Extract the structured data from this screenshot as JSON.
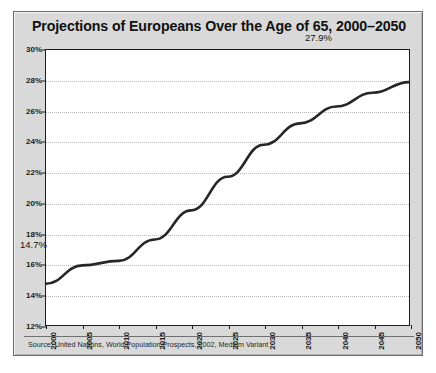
{
  "figure": {
    "title": "Projections of Europeans Over the Age of 65, 2000–2050",
    "source": "Source: United Nations, World Population Prospects, 2002, Medium Variant",
    "frame_color": "#d9d9d9",
    "plot_background": "#ffffff",
    "line_color": "#262626"
  },
  "chart_data": {
    "type": "line",
    "title": "Projections of Europeans Over the Age of 65, 2000–2050",
    "xlabel": "",
    "ylabel": "",
    "xlim": [
      2000,
      2050
    ],
    "ylim": [
      12,
      30
    ],
    "grid": true,
    "legend": false,
    "x": [
      2000,
      2005,
      2010,
      2015,
      2020,
      2025,
      2030,
      2035,
      2040,
      2045,
      2050
    ],
    "values": [
      14.7,
      15.9,
      16.2,
      17.6,
      19.5,
      21.7,
      23.8,
      25.2,
      26.3,
      27.2,
      27.9
    ],
    "xticks": [
      "2000",
      "2005",
      "2010",
      "2015",
      "2020",
      "2025",
      "2030",
      "2035",
      "2040",
      "2045",
      "2050"
    ],
    "yticks": [
      "12%",
      "14%",
      "16%",
      "18%",
      "20%",
      "22%",
      "24%",
      "26%",
      "28%",
      "30%"
    ],
    "ytick_values": [
      12,
      14,
      16,
      18,
      20,
      22,
      24,
      26,
      28,
      30
    ],
    "annotations": [
      {
        "text": "14.7%",
        "x": 2000,
        "y": 14.7
      },
      {
        "text": "27.9%",
        "x": 2050,
        "y": 27.9
      }
    ]
  },
  "labels": {
    "start_value": "14.7%",
    "end_value": "27.9%"
  }
}
